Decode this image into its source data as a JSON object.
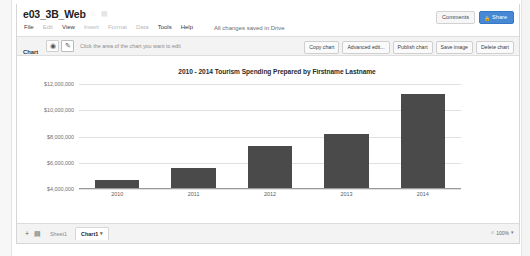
{
  "account": {
    "email": "firstname.lastname@gmail.com",
    "caret": "▾"
  },
  "header": {
    "doc_title": "e03_3B_Web",
    "star_icon": "☆",
    "folder_icon": "▤",
    "menu_items": [
      {
        "label": "File",
        "enabled": true
      },
      {
        "label": "Edit",
        "enabled": false
      },
      {
        "label": "View",
        "enabled": true
      },
      {
        "label": "Insert",
        "enabled": false
      },
      {
        "label": "Format",
        "enabled": false
      },
      {
        "label": "Data",
        "enabled": false
      },
      {
        "label": "Tools",
        "enabled": true
      },
      {
        "label": "Help",
        "enabled": true
      }
    ],
    "save_status": "All changes saved in Drive",
    "comments_label": "Comments",
    "share_label": "Share",
    "share_lock_icon": "🔒"
  },
  "chart_toolbar": {
    "label": "Chart",
    "eye_icon": "◉",
    "pencil_icon": "✎",
    "hint": "Click the area of the chart you want to edit",
    "buttons": [
      {
        "label": "Copy chart"
      },
      {
        "label": "Advanced edit..."
      },
      {
        "label": "Publish chart"
      },
      {
        "label": "Save image"
      },
      {
        "label": "Delete chart"
      }
    ]
  },
  "sheet_bar": {
    "add_icon": "+",
    "menu_icon": "▤",
    "tabs": [
      {
        "label": "Sheet1",
        "active": false
      },
      {
        "label": "Chart1",
        "active": true
      }
    ],
    "tab_caret": "▾",
    "zoom_icon": "⌕",
    "zoom_value": "100%",
    "zoom_caret": "▾"
  },
  "chart_data": {
    "type": "bar",
    "title": "2010 - 2014 Tourism Spending Prepared by Firstname Lastname",
    "xlabel": "",
    "ylabel": "",
    "categories": [
      "2010",
      "2011",
      "2012",
      "2013",
      "2014"
    ],
    "values": [
      4600000,
      5500000,
      7200000,
      8100000,
      11200000
    ],
    "ylim": [
      4000000,
      12000000
    ],
    "yticks": [
      12000000,
      10000000,
      8000000,
      6000000,
      4000000
    ],
    "ytick_labels": [
      "$12,000,000",
      "$10,000,000",
      "$8,000,000",
      "$6,000,000",
      "$4,000,000"
    ],
    "bar_color": "#4a4a4a",
    "grid": true,
    "legend": false
  }
}
